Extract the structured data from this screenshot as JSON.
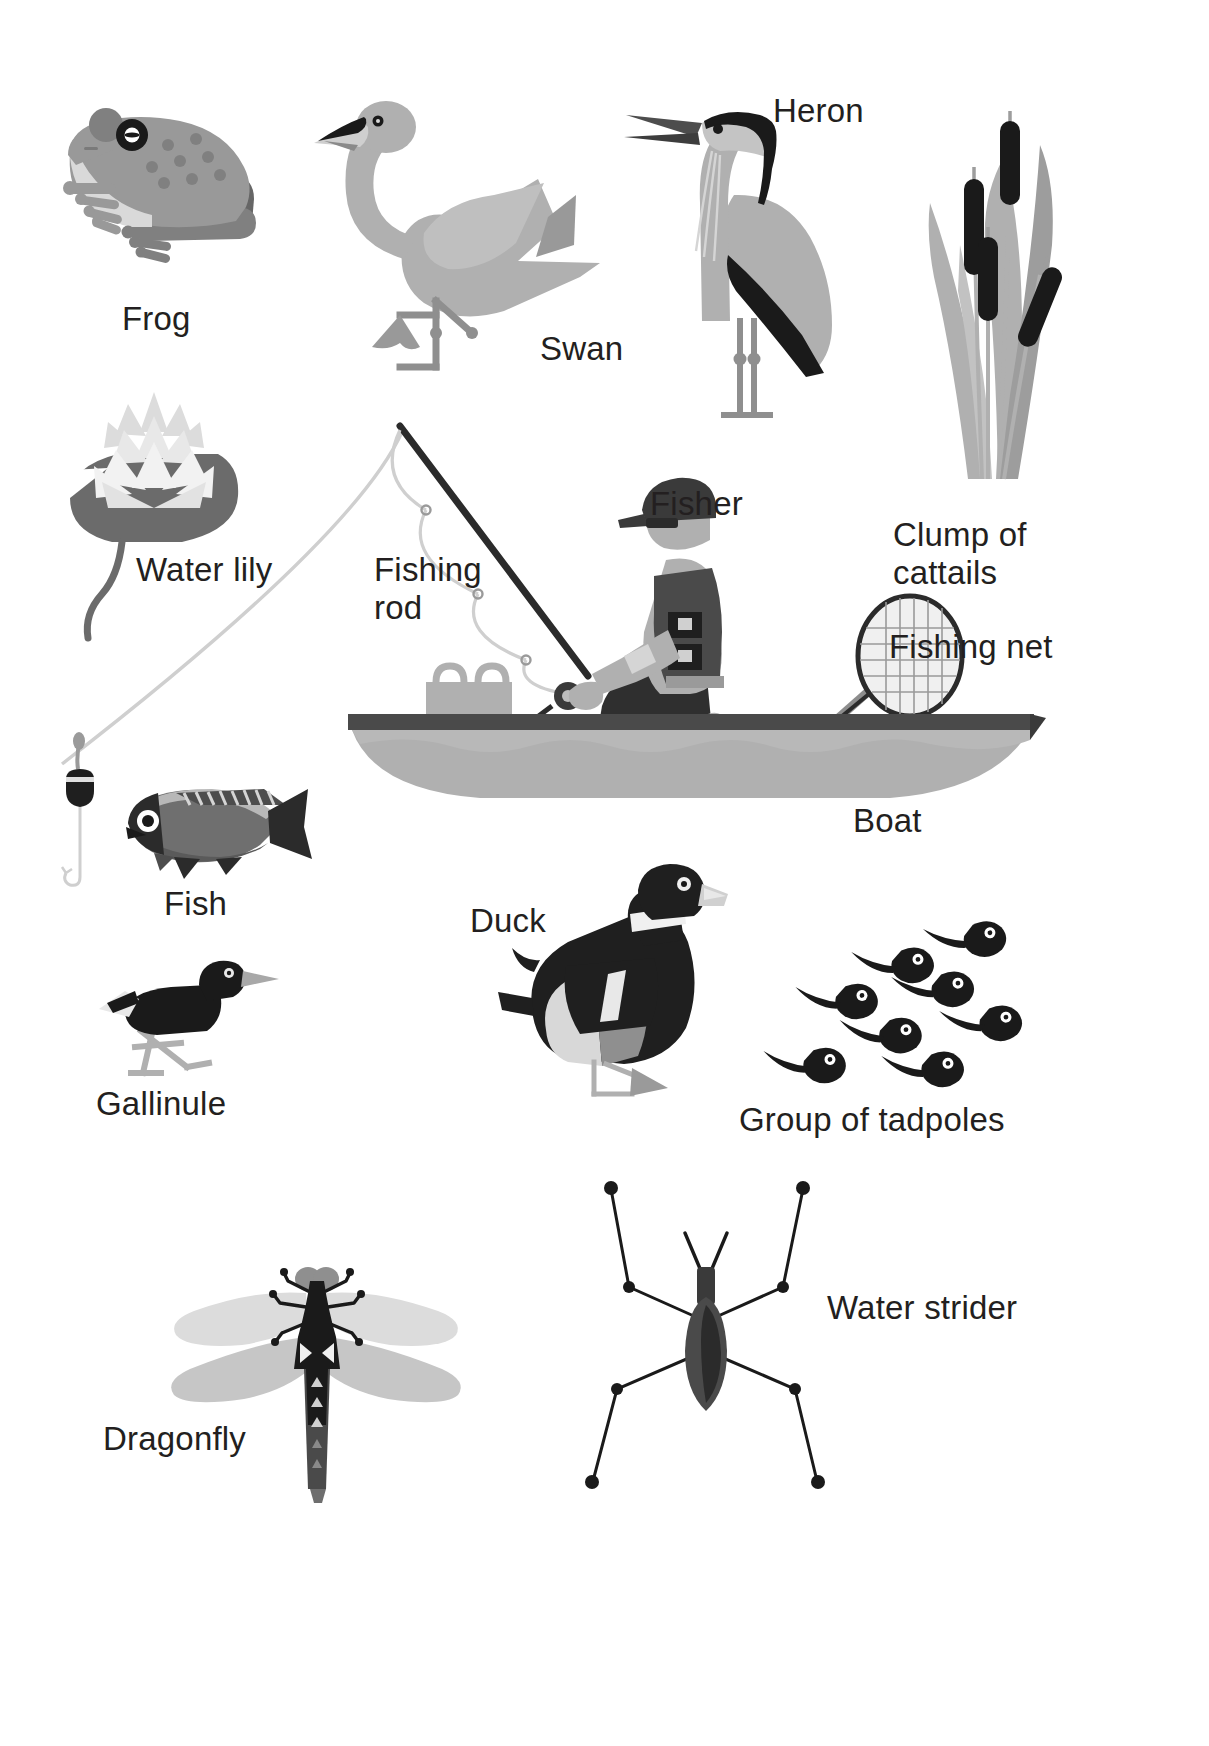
{
  "page": {
    "background_color": "#ffffff",
    "width": 1209,
    "height": 1746
  },
  "palette": {
    "ink": "#231f20",
    "black": "#1a1a1a",
    "dark_gray": "#4d4d4d",
    "mid_gray": "#808080",
    "gray": "#999999",
    "light_gray": "#b3b3b3",
    "pale_gray": "#cccccc",
    "very_pale": "#e0e0e0",
    "near_white": "#f2f2f2",
    "white": "#ffffff"
  },
  "labels": [
    {
      "id": "frog",
      "text": "Frog",
      "x": 122,
      "y": 300,
      "align": "left"
    },
    {
      "id": "swan",
      "text": "Swan",
      "x": 540,
      "y": 330,
      "align": "left"
    },
    {
      "id": "heron",
      "text": "Heron",
      "x": 773,
      "y": 92,
      "align": "left"
    },
    {
      "id": "cattails",
      "text": "Clump of\ncattails",
      "x": 893,
      "y": 516,
      "align": "left"
    },
    {
      "id": "water-lily",
      "text": "Water lily",
      "x": 136,
      "y": 551,
      "align": "left"
    },
    {
      "id": "fishing-rod",
      "text": "Fishing\nrod",
      "x": 374,
      "y": 551,
      "align": "left"
    },
    {
      "id": "fisher",
      "text": "Fisher",
      "x": 650,
      "y": 485,
      "align": "left"
    },
    {
      "id": "fishing-net",
      "text": "Fishing net",
      "x": 889,
      "y": 628,
      "align": "left"
    },
    {
      "id": "boat",
      "text": "Boat",
      "x": 853,
      "y": 802,
      "align": "left"
    },
    {
      "id": "fish",
      "text": "Fish",
      "x": 164,
      "y": 885,
      "align": "left"
    },
    {
      "id": "duck",
      "text": "Duck",
      "x": 470,
      "y": 902,
      "align": "left"
    },
    {
      "id": "tadpoles",
      "text": "Group of tadpoles",
      "x": 739,
      "y": 1101,
      "align": "left"
    },
    {
      "id": "gallinule",
      "text": "Gallinule",
      "x": 96,
      "y": 1085,
      "align": "left"
    },
    {
      "id": "water-strider",
      "text": "Water strider",
      "x": 827,
      "y": 1289,
      "align": "left"
    },
    {
      "id": "dragonfly",
      "text": "Dragonfly",
      "x": 103,
      "y": 1420,
      "align": "left"
    }
  ],
  "figures": [
    {
      "id": "frog",
      "name": "frog-illustration",
      "x": 40,
      "y": 95,
      "w": 240,
      "h": 180
    },
    {
      "id": "swan",
      "name": "swan-illustration",
      "x": 310,
      "y": 85,
      "w": 270,
      "h": 275
    },
    {
      "id": "heron",
      "name": "heron-illustration",
      "x": 620,
      "y": 85,
      "w": 250,
      "h": 330
    },
    {
      "id": "cattails",
      "name": "cattails-illustration",
      "x": 900,
      "y": 95,
      "w": 200,
      "h": 390
    },
    {
      "id": "water-lily",
      "name": "water-lily-illustration",
      "x": 55,
      "y": 370,
      "w": 190,
      "h": 250
    },
    {
      "id": "boat-scene",
      "name": "boat-and-fisher",
      "x": 330,
      "y": 420,
      "w": 710,
      "h": 370
    },
    {
      "id": "bobber-and-fish",
      "name": "bobber-line-and-fish",
      "x": 55,
      "y": 750,
      "w": 245,
      "h": 130
    },
    {
      "id": "gallinule",
      "name": "gallinule-illustration",
      "x": 95,
      "y": 955,
      "w": 190,
      "h": 120
    },
    {
      "id": "duck",
      "name": "duck-illustration",
      "x": 500,
      "y": 865,
      "w": 215,
      "h": 230
    },
    {
      "id": "tadpoles",
      "name": "tadpole-group",
      "x": 760,
      "y": 910,
      "w": 280,
      "h": 160
    },
    {
      "id": "dragonfly",
      "name": "dragonfly-illustration",
      "x": 165,
      "y": 1245,
      "w": 310,
      "h": 260
    },
    {
      "id": "water-strider",
      "name": "water-strider-illustration",
      "x": 555,
      "y": 1175,
      "w": 290,
      "h": 310
    }
  ],
  "tadpoles": [
    {
      "x": 112,
      "y": 38,
      "s": 1.0,
      "rot": -4
    },
    {
      "x": 182,
      "y": 15,
      "s": 1.0,
      "rot": -6
    },
    {
      "x": 60,
      "y": 72,
      "s": 1.0,
      "rot": -3
    },
    {
      "x": 152,
      "y": 62,
      "s": 1.0,
      "rot": -5
    },
    {
      "x": 100,
      "y": 104,
      "s": 1.0,
      "rot": -2
    },
    {
      "x": 196,
      "y": 92,
      "s": 1.0,
      "rot": -4
    },
    {
      "x": 22,
      "y": 136,
      "s": 1.0,
      "rot": -3
    },
    {
      "x": 140,
      "y": 140,
      "s": 1.0,
      "rot": -4
    }
  ],
  "cattails": [
    {
      "x": 64,
      "y": 12,
      "h": 78,
      "w": 19,
      "rot": 0
    },
    {
      "x": 26,
      "y": 58,
      "h": 92,
      "w": 19,
      "rot": 0
    },
    {
      "x": 56,
      "y": 122,
      "h": 78,
      "w": 19,
      "rot": 0
    },
    {
      "x": 92,
      "y": 148,
      "h": 78,
      "w": 19,
      "rot": 22
    }
  ]
}
